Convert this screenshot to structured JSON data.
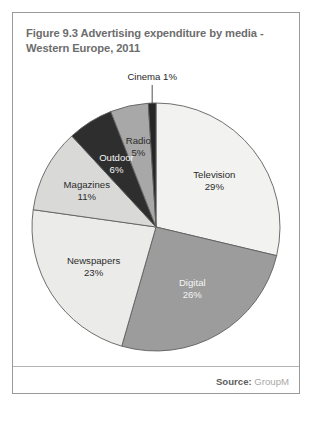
{
  "figure": {
    "title": "Figure 9.3  Advertising expenditure by media - Western Europe, 2011",
    "source_label": "Source:",
    "source_value": "GroupM"
  },
  "chart_data": {
    "type": "pie",
    "title": "Figure 9.3  Advertising expenditure by media - Western Europe, 2011",
    "unit": "%",
    "start_angle_deg": 0,
    "direction": "clockwise",
    "legend": "none",
    "labels_inside": true,
    "categories": [
      "Television",
      "Digital",
      "Newspapers",
      "Magazines",
      "Outdoor",
      "Radio",
      "Cinema"
    ],
    "values": [
      29,
      26,
      23,
      11,
      6,
      5,
      1
    ],
    "colors": [
      "#f2f2f0",
      "#9c9c9c",
      "#ebebe9",
      "#d9d9d7",
      "#2e2e2e",
      "#a8a8a8",
      "#262626"
    ],
    "slices": [
      {
        "name": "Television",
        "value": 29,
        "label": "Television",
        "value_label": "29%",
        "color": "#f2f2f0",
        "label_color": "dark",
        "callout": false
      },
      {
        "name": "Digital",
        "value": 26,
        "label": "Digital",
        "value_label": "26%",
        "color": "#9c9c9c",
        "label_color": "light",
        "callout": false
      },
      {
        "name": "Newspapers",
        "value": 23,
        "label": "Newspapers",
        "value_label": "23%",
        "color": "#ebebe9",
        "label_color": "dark",
        "callout": false
      },
      {
        "name": "Magazines",
        "value": 11,
        "label": "Magazines",
        "value_label": "11%",
        "color": "#d9d9d7",
        "label_color": "dark",
        "callout": false
      },
      {
        "name": "Outdoor",
        "value": 6,
        "label": "Outdoor",
        "value_label": "6%",
        "color": "#2e2e2e",
        "label_color": "light",
        "callout": false
      },
      {
        "name": "Radio",
        "value": 5,
        "label": "Radio",
        "value_label": "5%",
        "color": "#a8a8a8",
        "label_color": "dark",
        "callout": false
      },
      {
        "name": "Cinema",
        "value": 1,
        "label": "Cinema 1%",
        "value_label": "1%",
        "color": "#262626",
        "label_color": "dark",
        "callout": true
      }
    ]
  }
}
